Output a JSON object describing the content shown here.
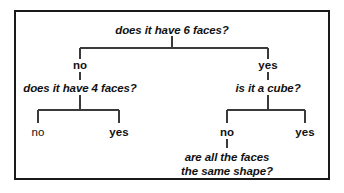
{
  "figure": {
    "type": "decision-tree",
    "frame_color": "#1a1a1a",
    "line_color": "#3a3a3a",
    "text_color": "#111111",
    "background": "#ffffff"
  },
  "nodes": {
    "root_question": "does it have 6 faces?",
    "root_branch_left_label": "no",
    "root_branch_right_label": "yes",
    "left_question": "does it have 4 faces?",
    "left_leaf_left_label": "no",
    "left_leaf_right_label": "yes",
    "right_question": "is it a cube?",
    "right_leaf_left_label": "no",
    "right_leaf_right_label": "yes",
    "final_question_line1": "are all the faces",
    "final_question_line2": "the same shape?"
  }
}
